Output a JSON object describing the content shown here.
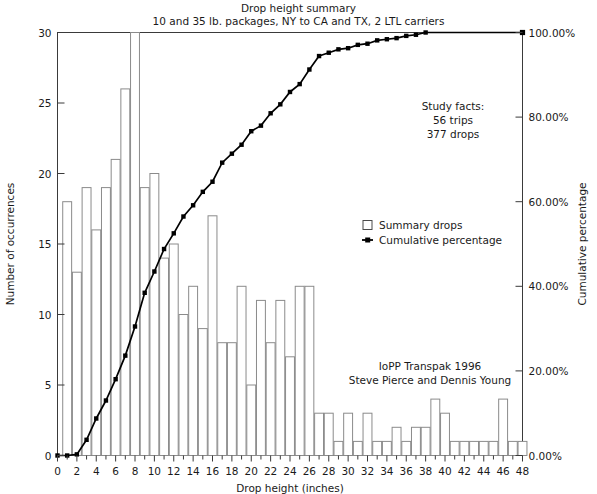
{
  "chart_data": {
    "type": "bar",
    "title": "Drop height summary",
    "subtitle": "10 and 35 lb. packages, NY to CA and TX, 2 LTL carriers",
    "xlabel": "Drop height (inches)",
    "ylabel": "Number of occurrences",
    "y2label": "Cumulative percentage",
    "xlim": [
      0,
      48
    ],
    "ylim": [
      0,
      30
    ],
    "y2lim": [
      0,
      100
    ],
    "grid": false,
    "legend_position": "center-right",
    "x_tick_labels": [
      "0",
      "2",
      "4",
      "6",
      "8",
      "10",
      "12",
      "14",
      "16",
      "18",
      "20",
      "22",
      "24",
      "26",
      "28",
      "30",
      "32",
      "34",
      "36",
      "38",
      "40",
      "42",
      "44",
      "46",
      "48"
    ],
    "x_tick_values": [
      0,
      2,
      4,
      6,
      8,
      10,
      12,
      14,
      16,
      18,
      20,
      22,
      24,
      26,
      28,
      30,
      32,
      34,
      36,
      38,
      40,
      42,
      44,
      46,
      48
    ],
    "x_minor_tick_values": [
      1,
      3,
      5,
      7,
      9,
      11,
      13,
      15,
      17,
      19,
      21,
      23,
      25,
      27,
      29,
      31,
      33,
      35,
      37,
      39,
      41,
      43,
      45,
      47
    ],
    "y_tick_labels": [
      "0",
      "5",
      "10",
      "15",
      "20",
      "25",
      "30"
    ],
    "y_tick_values": [
      0,
      5,
      10,
      15,
      20,
      25,
      30
    ],
    "y2_tick_labels": [
      "0.00%",
      "20.00%",
      "40.00%",
      "60.00%",
      "80.00%",
      "100.00%"
    ],
    "y2_tick_values": [
      0,
      20,
      40,
      60,
      80,
      100
    ],
    "categories": [
      1,
      2,
      3,
      4,
      5,
      6,
      7,
      8,
      9,
      10,
      11,
      12,
      13,
      14,
      15,
      16,
      17,
      18,
      19,
      20,
      21,
      22,
      23,
      24,
      25,
      26,
      27,
      28,
      29,
      30,
      31,
      32,
      33,
      34,
      35,
      36,
      37,
      38,
      39,
      40,
      41,
      42,
      43,
      44,
      45,
      46,
      47,
      48
    ],
    "series": [
      {
        "name": "Summary drops",
        "type": "bar",
        "values": [
          18,
          13,
          19,
          16,
          19,
          21,
          26,
          30,
          19,
          20,
          14,
          15,
          10,
          12,
          9,
          17,
          8,
          8,
          12,
          5,
          11,
          8,
          11,
          7,
          12,
          12,
          3,
          3,
          1,
          3,
          1,
          3,
          1,
          1,
          2,
          1,
          2,
          2,
          4,
          3,
          1,
          1,
          1,
          1,
          1,
          4,
          1,
          1
        ]
      },
      {
        "name": "Cumulative percentage",
        "type": "line",
        "values": [
          0.0,
          0.27,
          3.71,
          8.75,
          13.0,
          18.04,
          23.61,
          30.5,
          38.46,
          43.5,
          48.81,
          52.52,
          56.5,
          59.15,
          62.33,
          64.72,
          69.23,
          71.35,
          73.47,
          76.66,
          77.98,
          80.9,
          83.02,
          85.94,
          87.8,
          91.25,
          94.43,
          95.22,
          96.02,
          96.29,
          97.08,
          97.35,
          98.14,
          98.41,
          98.67,
          99.2,
          99.47,
          100.0,
          100.0,
          100.0,
          100.0,
          100.0,
          100.0,
          100.0,
          100.0,
          100.0,
          100.0,
          100.0
        ]
      }
    ],
    "annotations": [
      {
        "id": "study-facts",
        "lines": [
          "Study facts:",
          "56 trips",
          "377 drops"
        ]
      },
      {
        "id": "attribution",
        "lines": [
          "IoPP Transpak 1996",
          "Steve Pierce and Dennis Young"
        ]
      }
    ],
    "legend": [
      {
        "label": "Summary drops",
        "marker": "square"
      },
      {
        "label": "Cumulative percentage",
        "marker": "line-dot"
      }
    ]
  },
  "colors": {
    "bar_fill": "#ffffff",
    "bar_stroke": "#8b8b8b",
    "line": "#000000",
    "axis": "#3a3a3a",
    "text": "#1a1a1a",
    "background": "#ffffff"
  }
}
